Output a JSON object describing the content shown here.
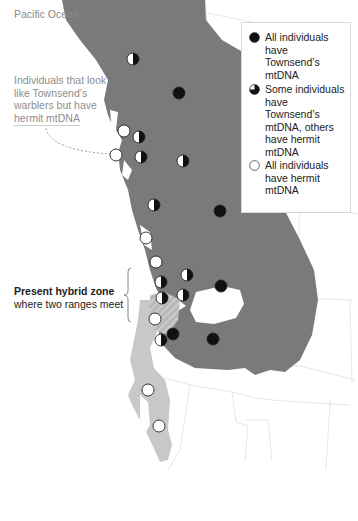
{
  "map": {
    "ocean_label": "Pacific Ocean",
    "callout": {
      "text": "Individuals that look like Townsend’s warblers but have hermit mtDNA"
    },
    "hybrid_zone": {
      "title": "Present hybrid zone",
      "subtitle": "where two ranges meet"
    },
    "legend": {
      "items": [
        {
          "symbol": "filled-circle",
          "label": "All individuals have Townsend’s mtDNA"
        },
        {
          "symbol": "half-filled-circle",
          "label": "Some individuals have Townsend’s mtDNA, others have hermit mtDNA"
        },
        {
          "symbol": "open-circle",
          "label": "All individuals have hermit mtDNA"
        }
      ]
    },
    "colors": {
      "townsend_range": "#7a7a7a",
      "hermit_range": "#c8c8c8",
      "border_lines": "#e6e6e6",
      "marker_fill_townsend": "#111111",
      "marker_fill_hermit": "#ffffff"
    },
    "markers": [
      {
        "type": "half",
        "x": 133,
        "y": 59
      },
      {
        "type": "full",
        "x": 179,
        "y": 93
      },
      {
        "type": "open",
        "x": 124,
        "y": 131
      },
      {
        "type": "half",
        "x": 139,
        "y": 137
      },
      {
        "type": "open",
        "x": 116,
        "y": 155
      },
      {
        "type": "half",
        "x": 141,
        "y": 157
      },
      {
        "type": "half",
        "x": 183,
        "y": 161
      },
      {
        "type": "half",
        "x": 154,
        "y": 205
      },
      {
        "type": "full",
        "x": 220,
        "y": 211
      },
      {
        "type": "open",
        "x": 146,
        "y": 238
      },
      {
        "type": "open",
        "x": 156,
        "y": 262
      },
      {
        "type": "half",
        "x": 187,
        "y": 275
      },
      {
        "type": "half",
        "x": 161,
        "y": 282
      },
      {
        "type": "full",
        "x": 221,
        "y": 286
      },
      {
        "type": "half",
        "x": 162,
        "y": 298
      },
      {
        "type": "half",
        "x": 183,
        "y": 295
      },
      {
        "type": "open",
        "x": 155,
        "y": 319
      },
      {
        "type": "full",
        "x": 173,
        "y": 334
      },
      {
        "type": "half",
        "x": 161,
        "y": 340
      },
      {
        "type": "full",
        "x": 213,
        "y": 339
      },
      {
        "type": "open",
        "x": 148,
        "y": 390
      },
      {
        "type": "open",
        "x": 159,
        "y": 426
      }
    ]
  }
}
